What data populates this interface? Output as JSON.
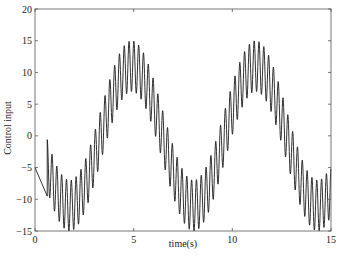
{
  "chart_data": {
    "type": "line",
    "title": "",
    "xlabel": "time(s)",
    "ylabel": "Control input",
    "xlim": [
      0,
      15
    ],
    "ylim": [
      -15,
      20
    ],
    "xticks": [
      0,
      5,
      10,
      15
    ],
    "xtick_labels": [
      "0",
      "5",
      "10",
      "15"
    ],
    "yticks": [
      -15,
      -10,
      -5,
      0,
      5,
      10,
      15,
      20
    ],
    "ytick_labels": [
      "-15",
      "-10",
      "-5",
      "0",
      "5",
      "10",
      "15",
      "20"
    ],
    "grid": false,
    "legend": null,
    "line_color": "#1a1a1a",
    "series": [
      {
        "name": "Control input",
        "description": "Initial ramp from -5 at t=0 to about -9.5 at t=0.62, then a slow sinusoid (amplitude ~11, period ~6.28 s, peaks near t=4.9 and t=11.2, troughs near t=1.8 and t=8.0) with superimposed fast oscillation (~4 Hz, amplitude ~4); envelope ranges from about -15 to +15.",
        "model": {
          "ramp": {
            "t0": 0,
            "y0": -5,
            "t1": 0.62,
            "y1": -9.5
          },
          "slow_amplitude": 11,
          "slow_omega": 1.0,
          "slow_phase_t0": 3.33,
          "fast_amplitude": 4,
          "fast_frequency_hz": 4.1,
          "t_start_oscillation": 0.62,
          "t_end": 15
        },
        "envelope_points": [
          {
            "t": 0,
            "y": -5
          },
          {
            "t": 0.62,
            "y": -9.5
          },
          {
            "t": 0.66,
            "y": -0.5
          },
          {
            "t": 1.8,
            "upper": -4,
            "lower": -14
          },
          {
            "t": 3.3,
            "upper": 4,
            "lower": -4
          },
          {
            "t": 4.9,
            "upper": 15,
            "lower": 7
          },
          {
            "t": 6.5,
            "upper": 4,
            "lower": -4
          },
          {
            "t": 8.0,
            "upper": -7,
            "lower": -15
          },
          {
            "t": 9.6,
            "upper": 4,
            "lower": -4
          },
          {
            "t": 11.2,
            "upper": 15,
            "lower": 7
          },
          {
            "t": 12.8,
            "upper": 4,
            "lower": -4
          },
          {
            "t": 14.3,
            "upper": -7,
            "lower": -15
          },
          {
            "t": 15,
            "upper": -5,
            "lower": -13
          }
        ]
      }
    ]
  }
}
